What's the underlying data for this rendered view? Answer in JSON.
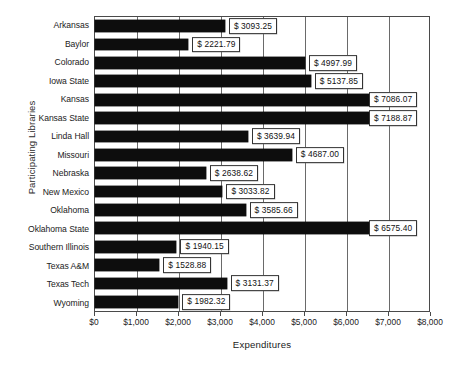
{
  "chart_data": {
    "type": "bar",
    "orientation": "horizontal",
    "title": "",
    "xlabel": "Expenditures",
    "ylabel": "Participating Libraries",
    "xlim": [
      0,
      8000
    ],
    "xticks": [
      0,
      1000,
      2000,
      3000,
      4000,
      5000,
      6000,
      7000,
      8000
    ],
    "xticklabels": [
      "$0",
      "$1,000",
      "$2,000",
      "$3,000",
      "$4,000",
      "$5,000",
      "$6,000",
      "$7,000",
      "$8,000"
    ],
    "grid": true,
    "legend": false,
    "categories": [
      "Arkansas",
      "Baylor",
      "Colorado",
      "Iowa State",
      "Kansas",
      "Kansas State",
      "Linda Hall",
      "Missouri",
      "Nebraska",
      "New Mexico",
      "Oklahoma",
      "Oklahoma State",
      "Southern Illinois",
      "Texas A&M",
      "Texas Tech",
      "Wyoming"
    ],
    "values": [
      3093.25,
      2221.79,
      4997.99,
      5137.85,
      7086.07,
      7188.87,
      3639.94,
      4687.0,
      2638.62,
      3033.82,
      3585.66,
      6575.4,
      1940.15,
      1528.88,
      3131.37,
      1982.32
    ],
    "value_labels": [
      "$ 3093.25",
      "$ 2221.79",
      "$ 4997.99",
      "$ 5137.85",
      "$ 7086.07",
      "$ 7188.87",
      "$ 3639.94",
      "$ 4687.00",
      "$ 2638.62",
      "$ 3033.82",
      "$ 3585.66",
      "$ 6575.40",
      "$ 1940.15",
      "$ 1528.88",
      "$ 3131.37",
      "$ 1982.32"
    ],
    "colors": {
      "bar": "#0d0d0d",
      "plot_background": "#ffffff",
      "axis": "#4a4a4a",
      "grid": "#6a6a6a",
      "label_box_background": "#ffffff",
      "label_box_border": "#333333",
      "text": "#222222"
    }
  }
}
